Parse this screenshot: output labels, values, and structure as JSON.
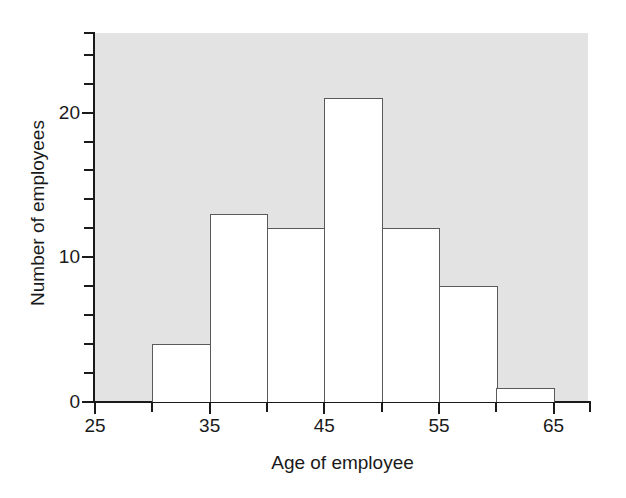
{
  "chart_data": {
    "type": "bar",
    "subtype": "histogram",
    "title": "",
    "xlabel": "Age of employee",
    "ylabel": "Number of employees",
    "xlim": [
      25,
      68
    ],
    "ylim": [
      0,
      25.5
    ],
    "grid": false,
    "legend": null,
    "bin_width": 5,
    "bin_edges": [
      30,
      35,
      40,
      45,
      50,
      55,
      60,
      65
    ],
    "categories": [
      "30-35",
      "35-40",
      "40-45",
      "45-50",
      "50-55",
      "55-60",
      "60-65"
    ],
    "values": [
      4,
      13,
      12,
      21,
      12,
      8,
      1
    ],
    "bars": [
      {
        "bin_start": 30,
        "bin_end": 35,
        "count": 4
      },
      {
        "bin_start": 35,
        "bin_end": 40,
        "count": 13
      },
      {
        "bin_start": 40,
        "bin_end": 45,
        "count": 12
      },
      {
        "bin_start": 45,
        "bin_end": 50,
        "count": 21
      },
      {
        "bin_start": 50,
        "bin_end": 55,
        "count": 12
      },
      {
        "bin_start": 55,
        "bin_end": 60,
        "count": 8
      },
      {
        "bin_start": 60,
        "bin_end": 65,
        "count": 1
      }
    ],
    "x_ticks_major": [
      25,
      35,
      45,
      55,
      65
    ],
    "x_tick_labels": [
      "25",
      "35",
      "45",
      "55",
      "65"
    ],
    "x_ticks_minor": [
      30,
      40,
      50,
      60
    ],
    "y_ticks_major": [
      0,
      10,
      20
    ],
    "y_tick_labels": [
      "0",
      "10",
      "20"
    ],
    "y_ticks_minor": [
      2,
      4,
      6,
      8,
      12,
      14,
      16,
      18,
      22,
      24
    ],
    "colors": {
      "plot_background": "#e3e3e3",
      "bar_fill": "#ffffff",
      "bar_edge": "#5a5a5a",
      "axis": "#1a1a1a",
      "text": "#1a1a1a",
      "figure_background": "#ffffff"
    }
  }
}
